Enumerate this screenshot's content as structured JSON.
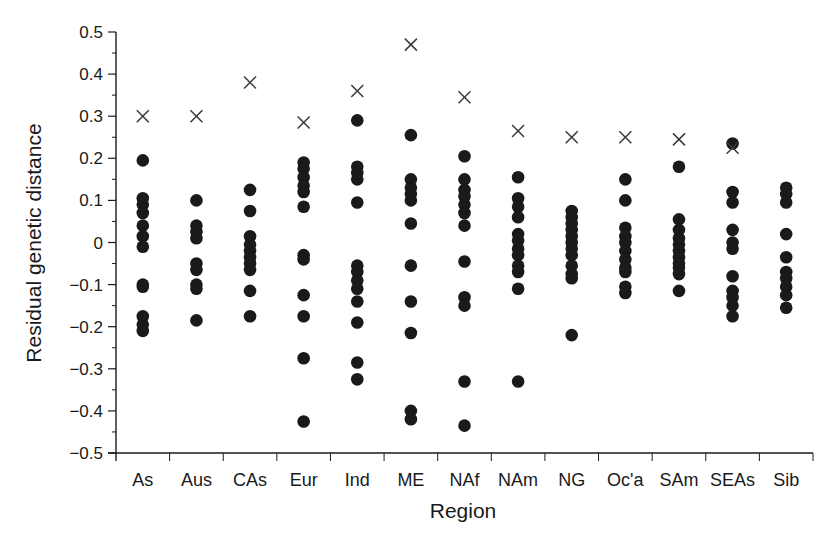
{
  "chart_data": {
    "type": "scatter",
    "title": "",
    "xlabel": "Region",
    "ylabel": "Residual genetic distance",
    "ylim": [
      -0.5,
      0.5
    ],
    "yticks": [
      "0.5",
      "0.4",
      "0.3",
      "0.2",
      "0.1",
      "0",
      "-0.1",
      "-0.2",
      "-0.3",
      "-0.4",
      "-0.5"
    ],
    "ytick_values": [
      0.5,
      0.4,
      0.3,
      0.2,
      0.1,
      0,
      -0.1,
      -0.2,
      -0.3,
      -0.4,
      -0.5
    ],
    "grid": false,
    "legend": null,
    "categories": [
      "As",
      "Aus",
      "CAs",
      "Eur",
      "Ind",
      "ME",
      "NAf",
      "NAm",
      "NG",
      "Oc'a",
      "SAm",
      "SEAs",
      "Sib"
    ],
    "series": [
      {
        "name": "populations",
        "marker": "filled-circle",
        "points": {
          "As": [
            0.195,
            0.105,
            0.09,
            0.07,
            0.04,
            0.015,
            -0.01,
            -0.1,
            -0.105,
            -0.175,
            -0.195,
            -0.21
          ],
          "Aus": [
            0.1,
            0.04,
            0.025,
            0.01,
            -0.05,
            -0.065,
            -0.1,
            -0.11,
            -0.185
          ],
          "CAs": [
            0.125,
            0.075,
            0.015,
            -0.005,
            -0.02,
            -0.035,
            -0.05,
            -0.065,
            -0.115,
            -0.175
          ],
          "Eur": [
            0.19,
            0.175,
            0.155,
            0.135,
            0.12,
            0.085,
            -0.03,
            -0.04,
            -0.125,
            -0.175,
            -0.275,
            -0.425
          ],
          "Ind": [
            0.29,
            0.18,
            0.165,
            0.15,
            0.095,
            -0.055,
            -0.07,
            -0.09,
            -0.11,
            -0.14,
            -0.19,
            -0.285,
            -0.325
          ],
          "ME": [
            0.255,
            0.15,
            0.13,
            0.115,
            0.1,
            0.045,
            -0.055,
            -0.14,
            -0.215,
            -0.4,
            -0.42
          ],
          "NAf": [
            0.205,
            0.15,
            0.125,
            0.11,
            0.09,
            0.07,
            0.04,
            -0.045,
            -0.13,
            -0.15,
            -0.33,
            -0.435
          ],
          "NAm": [
            0.155,
            0.105,
            0.085,
            0.06,
            0.02,
            0.005,
            -0.015,
            -0.03,
            -0.055,
            -0.07,
            -0.11,
            -0.33
          ],
          "NG": [
            0.075,
            0.06,
            0.045,
            0.03,
            0.015,
            0.0,
            -0.015,
            -0.03,
            -0.055,
            -0.075,
            -0.085,
            -0.22
          ],
          "Oc'a": [
            0.15,
            0.1,
            0.035,
            0.015,
            0.0,
            -0.02,
            -0.04,
            -0.06,
            -0.07,
            -0.105,
            -0.12
          ],
          "SAm": [
            0.18,
            0.055,
            0.03,
            0.01,
            -0.005,
            -0.02,
            -0.035,
            -0.05,
            -0.06,
            -0.075,
            -0.115
          ],
          "SEAs": [
            0.235,
            0.12,
            0.095,
            0.03,
            0.0,
            -0.015,
            -0.08,
            -0.115,
            -0.13,
            -0.15,
            -0.175
          ],
          "Sib": [
            0.13,
            0.115,
            0.095,
            0.02,
            -0.035,
            -0.07,
            -0.085,
            -0.105,
            -0.125,
            -0.155
          ]
        }
      },
      {
        "name": "cross-markers",
        "marker": "x",
        "values": [
          0.3,
          0.3,
          0.38,
          0.285,
          0.36,
          0.47,
          0.345,
          0.265,
          0.25,
          0.25,
          0.245,
          0.225,
          null
        ]
      }
    ]
  },
  "colors": {
    "ink": "#1a1a1a",
    "cross": "#3a3a3a",
    "background": "#ffffff"
  }
}
